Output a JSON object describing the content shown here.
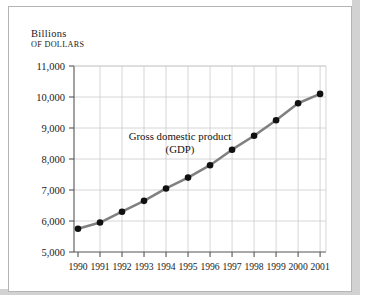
{
  "axis_title": {
    "line1": "Billions",
    "line2": "of dollars"
  },
  "colors": {
    "line": "#808080",
    "marker": "#101010",
    "grid": "#cccccc",
    "axis": "#555555",
    "text": "#1a1a1a",
    "card_background": "#ffffff",
    "page_background": "#d2d2d2"
  },
  "chart_data": {
    "type": "line",
    "title": "",
    "xlabel": "",
    "ylabel": "Billions of dollars",
    "annotation": "Gross domestic product (GDP)",
    "annotation_lines": [
      "Gross domestic product",
      "(GDP)"
    ],
    "grid": true,
    "legend": "none",
    "ylim": [
      5000,
      11000
    ],
    "yticks": [
      5000,
      6000,
      7000,
      8000,
      9000,
      10000,
      11000
    ],
    "ytick_labels": [
      "5,000",
      "6,000",
      "7,000",
      "8,000",
      "9,000",
      "10,000",
      "11,000"
    ],
    "categories": [
      1990,
      1991,
      1992,
      1993,
      1994,
      1995,
      1996,
      1997,
      1998,
      1999,
      2000,
      2001
    ],
    "xtick_labels": [
      "1990",
      "1991",
      "1992",
      "1993",
      "1994",
      "1995",
      "1996",
      "1997",
      "1998",
      "1999",
      "2000",
      "2001"
    ],
    "series": [
      {
        "name": "Gross domestic product (GDP)",
        "values": [
          5750,
          5950,
          6300,
          6650,
          7050,
          7400,
          7800,
          8300,
          8750,
          9250,
          9800,
          10100
        ]
      }
    ]
  }
}
